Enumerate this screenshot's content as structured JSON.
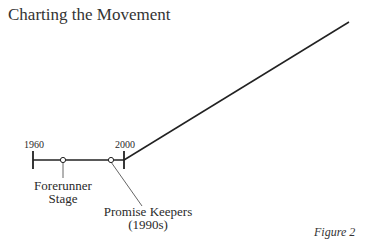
{
  "title": "Charting the Movement",
  "figure_label": "Figure 2",
  "timeline": {
    "start_label": "1960",
    "end_label": "2000",
    "markers": [
      {
        "label_line1": "Forerunner",
        "label_line2": "Stage"
      },
      {
        "label_line1": "Promise Keepers",
        "label_line2": "(1990s)"
      }
    ]
  },
  "colors": {
    "line": "#222222",
    "leader": "#666666"
  }
}
